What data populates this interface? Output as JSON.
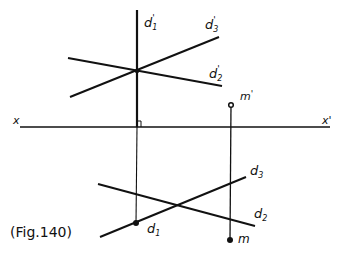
{
  "figure": {
    "caption": "(Fig.140)",
    "axis": {
      "left_label": "x",
      "right_label": "x'"
    },
    "labels": {
      "d1_prime": "d'1",
      "d2_prime": "d'2",
      "d3_prime": "d'3",
      "m_prime": "m'",
      "d1": "d1",
      "d2": "d2",
      "d3": "d3",
      "m": "m"
    },
    "label_parts": {
      "d1_prime": [
        "d",
        "1",
        "'"
      ],
      "d2_prime": [
        "d",
        "2",
        "'"
      ],
      "d3_prime": [
        "d",
        "3",
        "'"
      ],
      "m_prime": [
        "m",
        "'"
      ],
      "d1": [
        "d",
        "1"
      ],
      "d2": [
        "d",
        "2"
      ],
      "d3": [
        "d",
        "3"
      ],
      "m": [
        "m"
      ]
    },
    "colors": {
      "ink": "#111111",
      "background": "#ffffff"
    }
  }
}
